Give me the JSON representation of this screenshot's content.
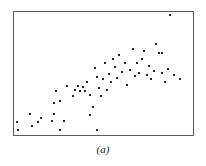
{
  "figure": {
    "caption": "(a)",
    "frame": {
      "x": 13,
      "y": 11,
      "width": 181,
      "height": 125,
      "border_color": "#5a5a5a"
    },
    "point_color": "#262626",
    "point_size_px": 2
  },
  "chart_data": {
    "type": "scatter",
    "title": "",
    "subtitle": "",
    "xlabel": "",
    "ylabel": "",
    "caption": "(a)",
    "grid": false,
    "legend": null,
    "axis_ticks": [],
    "xlim": [
      0,
      100
    ],
    "ylim": [
      0,
      100
    ],
    "n_points": 61,
    "x": [
      1.7,
      9.5,
      12.8,
      25.0,
      45.5,
      1.1,
      22.2,
      41.7,
      8.9,
      15.0,
      21.1,
      22.8,
      23.9,
      26.1,
      28.3,
      30.0,
      33.3,
      34.4,
      36.1,
      37.2,
      38.9,
      40.0,
      41.1,
      43.3,
      45.0,
      46.1,
      47.2,
      48.3,
      50.0,
      51.1,
      52.2,
      53.3,
      54.4,
      55.6,
      56.7,
      57.8,
      58.9,
      60.0,
      61.7,
      63.3,
      65.0,
      66.7,
      68.3,
      70.0,
      71.1,
      72.2,
      73.9,
      75.6,
      77.2,
      78.3,
      79.4,
      81.1,
      82.8,
      84.4,
      86.1,
      86.1,
      87.8,
      90.0,
      93.3,
      96.7,
      86.1
    ],
    "y": [
      4.8,
      12.0,
      20.0,
      6.4,
      6.4,
      20.0,
      28.0,
      27.2,
      28.8,
      24.0,
      21.6,
      36.0,
      45.6,
      32.0,
      20.8,
      49.6,
      41.6,
      52.0,
      55.2,
      49.6,
      53.6,
      50.4,
      57.6,
      47.2,
      36.0,
      67.2,
      60.0,
      51.2,
      44.0,
      58.4,
      71.2,
      49.6,
      63.2,
      56.0,
      75.2,
      68.8,
      60.0,
      77.6,
      64.0,
      71.2,
      54.4,
      66.4,
      79.2,
      58.4,
      70.4,
      62.4,
      75.2,
      81.6,
      60.8,
      69.6,
      57.6,
      64.8,
      83.2,
      76.0,
      62.4,
      78.4,
      56.0,
      66.4,
      61.6,
      58.4,
      96.0
    ],
    "points_px": [
      [
        17,
        129
      ],
      [
        31,
        125
      ],
      [
        37,
        121
      ],
      [
        59,
        129
      ],
      [
        96,
        129
      ],
      [
        16,
        121
      ],
      [
        53,
        113
      ],
      [
        89,
        114
      ],
      [
        29,
        113
      ],
      [
        40,
        117
      ],
      [
        51,
        120
      ],
      [
        53,
        102
      ],
      [
        55,
        90
      ],
      [
        59,
        100
      ],
      [
        63,
        120
      ],
      [
        66,
        85
      ],
      [
        72,
        95
      ],
      [
        74,
        89
      ],
      [
        77,
        85
      ],
      [
        79,
        90
      ],
      [
        82,
        86
      ],
      [
        84,
        90
      ],
      [
        86,
        81
      ],
      [
        89,
        94
      ],
      [
        92,
        106
      ],
      [
        94,
        67
      ],
      [
        96,
        76
      ],
      [
        98,
        87
      ],
      [
        100,
        95
      ],
      [
        102,
        78
      ],
      [
        104,
        62
      ],
      [
        106,
        89
      ],
      [
        108,
        73
      ],
      [
        110,
        81
      ],
      [
        112,
        58
      ],
      [
        114,
        66
      ],
      [
        116,
        77
      ],
      [
        118,
        54
      ],
      [
        121,
        71
      ],
      [
        124,
        62
      ],
      [
        126,
        84
      ],
      [
        129,
        69
      ],
      [
        132,
        48
      ],
      [
        134,
        75
      ],
      [
        136,
        62
      ],
      [
        138,
        72
      ],
      [
        141,
        58
      ],
      [
        143,
        50
      ],
      [
        146,
        74
      ],
      [
        148,
        65
      ],
      [
        150,
        78
      ],
      [
        153,
        70
      ],
      [
        155,
        43
      ],
      [
        158,
        52
      ],
      [
        161,
        72
      ],
      [
        161,
        52
      ],
      [
        164,
        81
      ],
      [
        167,
        68
      ],
      [
        173,
        74
      ],
      [
        179,
        78
      ],
      [
        169,
        14
      ]
    ]
  }
}
